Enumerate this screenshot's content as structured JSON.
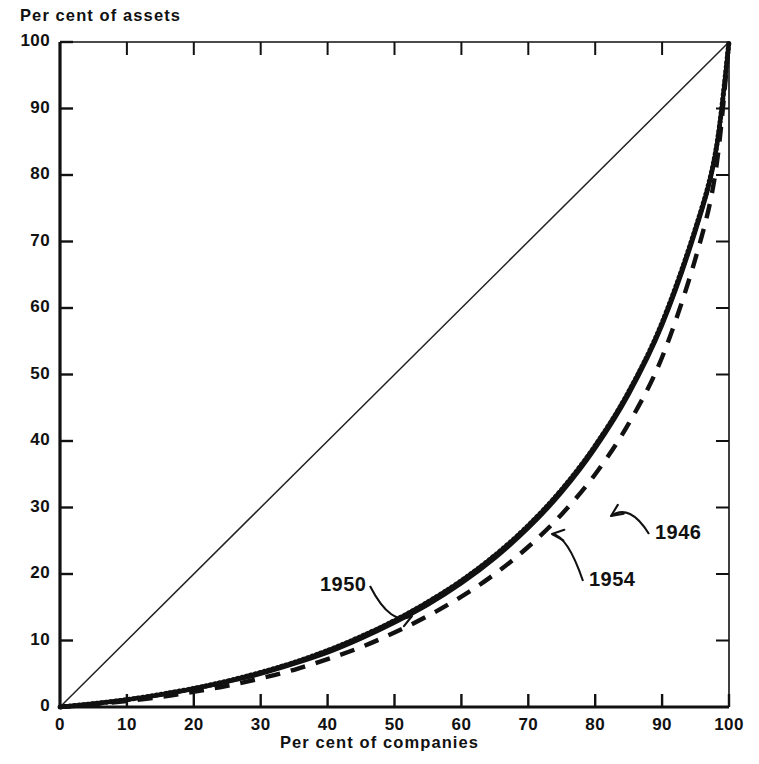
{
  "chart_data": {
    "type": "line",
    "title": "",
    "xlabel": "Per cent of companies",
    "ylabel": "Per cent of assets",
    "xlim": [
      0,
      100
    ],
    "ylim": [
      0,
      100
    ],
    "xticks": [
      0,
      10,
      20,
      30,
      40,
      50,
      60,
      70,
      80,
      90,
      100
    ],
    "yticks": [
      0,
      10,
      20,
      30,
      40,
      50,
      60,
      70,
      80,
      90,
      100
    ],
    "xtick_labels": [
      "0",
      "10",
      "20",
      "30",
      "40",
      "50",
      "60",
      "70",
      "80",
      "90",
      "100"
    ],
    "ytick_labels": [
      "0",
      "10",
      "20",
      "30",
      "40",
      "50",
      "60",
      "70",
      "80",
      "90",
      "100"
    ],
    "grid": false,
    "legend_position": "inline-annotations",
    "reference_line": {
      "name": "line-of-equality",
      "style": "thin-solid",
      "x": [
        0,
        100
      ],
      "y": [
        0,
        100
      ]
    },
    "series": [
      {
        "name": "1950",
        "style": "dotted",
        "annotation": "1950",
        "x": [
          0,
          5,
          10,
          15,
          20,
          25,
          30,
          35,
          40,
          45,
          50,
          55,
          60,
          65,
          70,
          75,
          80,
          85,
          90,
          95,
          98,
          100
        ],
        "values": [
          0,
          0.5,
          1.1,
          1.9,
          2.8,
          3.9,
          5.2,
          6.7,
          8.5,
          10.6,
          13.0,
          15.8,
          19.0,
          22.8,
          27.3,
          32.7,
          39.3,
          47.4,
          57.8,
          72.0,
          83.5,
          100
        ]
      },
      {
        "name": "1954",
        "style": "solid",
        "annotation": "1954",
        "x": [
          0,
          5,
          10,
          15,
          20,
          25,
          30,
          35,
          40,
          45,
          50,
          55,
          60,
          65,
          70,
          75,
          80,
          85,
          90,
          95,
          98,
          100
        ],
        "values": [
          0,
          0.5,
          1.1,
          1.8,
          2.7,
          3.8,
          5.0,
          6.5,
          8.2,
          10.3,
          12.7,
          15.4,
          18.6,
          22.4,
          26.9,
          32.3,
          38.9,
          47.0,
          57.4,
          71.6,
          83.2,
          100
        ]
      },
      {
        "name": "1946",
        "style": "dashed",
        "annotation": "1946",
        "x": [
          0,
          5,
          10,
          15,
          20,
          25,
          30,
          35,
          40,
          45,
          50,
          55,
          60,
          65,
          70,
          75,
          80,
          85,
          90,
          95,
          98,
          100
        ],
        "values": [
          0,
          0.4,
          0.9,
          1.5,
          2.3,
          3.2,
          4.3,
          5.6,
          7.2,
          9.0,
          11.2,
          13.7,
          16.6,
          20.0,
          24.1,
          29.0,
          35.0,
          42.6,
          52.6,
          67.5,
          80.5,
          100
        ]
      }
    ],
    "annotations": [
      {
        "label": "1950",
        "text_x": 320,
        "text_y": 573,
        "arrow_to_x": 412,
        "arrow_to_y": 616
      },
      {
        "label": "1954",
        "text_x": 589,
        "text_y": 568,
        "arrow_to_x": 552,
        "arrow_to_y": 534
      },
      {
        "label": "1946",
        "text_x": 655,
        "text_y": 521,
        "arrow_to_x": 611,
        "arrow_to_y": 516
      }
    ]
  },
  "colors": {
    "ink": "#111111",
    "background": "#ffffff",
    "reference_line": "#222222"
  }
}
